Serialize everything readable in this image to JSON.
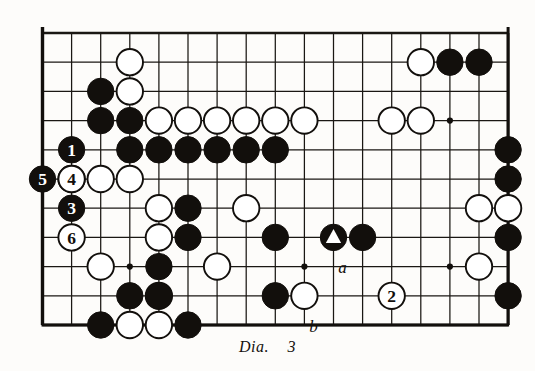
{
  "figure": {
    "caption_label": "Dia.",
    "caption_number": "3",
    "type": "go-board-diagram"
  },
  "board": {
    "columns": 17,
    "rows": 11,
    "line_color": "#1a1713",
    "border_color": "#120f0c",
    "background": "#fdfcfa",
    "black_color": "#120f0c",
    "white_color": "#ffffff",
    "star_points": [
      {
        "col": 3,
        "row": 8
      },
      {
        "col": 9,
        "row": 8
      },
      {
        "col": 14,
        "row": 3
      },
      {
        "col": 14,
        "row": 8
      }
    ]
  },
  "stones": {
    "black": [
      {
        "col": 2,
        "row": 2
      },
      {
        "col": 2,
        "row": 3
      },
      {
        "col": 3,
        "row": 3
      },
      {
        "col": 3,
        "row": 4
      },
      {
        "col": 4,
        "row": 4
      },
      {
        "col": 5,
        "row": 4
      },
      {
        "col": 6,
        "row": 4
      },
      {
        "col": 7,
        "row": 4
      },
      {
        "col": 8,
        "row": 4
      },
      {
        "col": 14,
        "row": 1
      },
      {
        "col": 15,
        "row": 1
      },
      {
        "col": 16,
        "row": 4
      },
      {
        "col": 16,
        "row": 5
      },
      {
        "col": 5,
        "row": 6
      },
      {
        "col": 5,
        "row": 7
      },
      {
        "col": 4,
        "row": 8
      },
      {
        "col": 4,
        "row": 9
      },
      {
        "col": 3,
        "row": 9
      },
      {
        "col": 5,
        "row": 10
      },
      {
        "col": 8,
        "row": 7
      },
      {
        "col": 8,
        "row": 9
      },
      {
        "col": 11,
        "row": 7
      },
      {
        "col": 16,
        "row": 7
      },
      {
        "col": 16,
        "row": 9
      },
      {
        "col": 2,
        "row": 10
      }
    ],
    "white": [
      {
        "col": 3,
        "row": 1
      },
      {
        "col": 3,
        "row": 2
      },
      {
        "col": 4,
        "row": 3
      },
      {
        "col": 5,
        "row": 3
      },
      {
        "col": 6,
        "row": 3
      },
      {
        "col": 7,
        "row": 3
      },
      {
        "col": 8,
        "row": 3
      },
      {
        "col": 9,
        "row": 3
      },
      {
        "col": 13,
        "row": 1
      },
      {
        "col": 12,
        "row": 3
      },
      {
        "col": 13,
        "row": 3
      },
      {
        "col": 1,
        "row": 5
      },
      {
        "col": 2,
        "row": 5
      },
      {
        "col": 3,
        "row": 5
      },
      {
        "col": 4,
        "row": 6
      },
      {
        "col": 7,
        "row": 6
      },
      {
        "col": 4,
        "row": 7
      },
      {
        "col": 2,
        "row": 8
      },
      {
        "col": 6,
        "row": 8
      },
      {
        "col": 15,
        "row": 6
      },
      {
        "col": 16,
        "row": 6
      },
      {
        "col": 15,
        "row": 8
      },
      {
        "col": 4,
        "row": 9
      },
      {
        "col": 3,
        "row": 10
      },
      {
        "col": 4,
        "row": 10
      },
      {
        "col": 9,
        "row": 9
      }
    ]
  },
  "numbered_moves": [
    {
      "label": "1",
      "color": "black",
      "col": 1,
      "row": 4,
      "name": "move-1-black"
    },
    {
      "label": "2",
      "color": "white",
      "col": 12,
      "row": 9,
      "name": "move-2-white"
    },
    {
      "label": "3",
      "color": "black",
      "col": 1,
      "row": 6,
      "name": "move-3-black"
    },
    {
      "label": "4",
      "color": "white",
      "col": 1,
      "row": 5,
      "name": "move-4-white"
    },
    {
      "label": "5",
      "color": "black",
      "col": 0,
      "row": 5,
      "name": "move-5-black"
    },
    {
      "label": "6",
      "color": "white",
      "col": 1,
      "row": 7,
      "name": "move-6-white"
    }
  ],
  "markers": [
    {
      "kind": "triangle",
      "color": "black",
      "col": 10,
      "row": 7,
      "name": "triangle-marked-black-stone"
    }
  ],
  "point_labels": [
    {
      "label": "a",
      "col": 10,
      "row": 8,
      "name": "point-label-a"
    },
    {
      "label": "b",
      "col": 9,
      "row": 10,
      "name": "point-label-b"
    }
  ]
}
